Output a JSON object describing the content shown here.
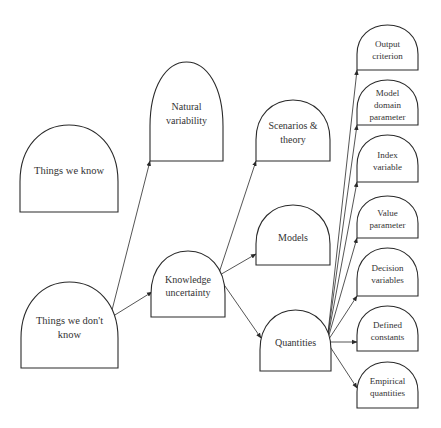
{
  "diagram": {
    "type": "tree",
    "style": {
      "stroke_color": "#2a2a2a",
      "text_color": "#333333",
      "background": "#ffffff"
    },
    "nodes": [
      {
        "id": "known",
        "lines": [
          "Things we know"
        ],
        "box": [
          20,
          125,
          118,
          212
        ],
        "font": 10.5
      },
      {
        "id": "unknown",
        "lines": [
          "Things we don't",
          "know"
        ],
        "box": [
          21,
          282,
          118,
          368
        ],
        "font": 10.5
      },
      {
        "id": "natural",
        "lines": [
          "Natural",
          "variability"
        ],
        "box": [
          150,
          62,
          223,
          161
        ],
        "font": 10
      },
      {
        "id": "knowledge",
        "lines": [
          "Knowledge",
          "uncertainty"
        ],
        "box": [
          151,
          251,
          225,
          317
        ],
        "font": 10
      },
      {
        "id": "scenarios",
        "lines": [
          "Scenarios &",
          "theory"
        ],
        "box": [
          256,
          100,
          330,
          161
        ],
        "font": 10
      },
      {
        "id": "models",
        "lines": [
          "Models"
        ],
        "box": [
          256,
          205,
          330,
          265
        ],
        "font": 10
      },
      {
        "id": "quantities",
        "lines": [
          "Quantities"
        ],
        "box": [
          260,
          310,
          331,
          371
        ],
        "font": 10
      },
      {
        "id": "output",
        "lines": [
          "Output",
          "criterion"
        ],
        "box": [
          357,
          25,
          418,
          70
        ],
        "font": 9
      },
      {
        "id": "model-domain",
        "lines": [
          "Model",
          "domain",
          "parameter"
        ],
        "box": [
          357,
          80,
          418,
          125
        ],
        "font": 9
      },
      {
        "id": "index",
        "lines": [
          "Index",
          "variable"
        ],
        "box": [
          357,
          135,
          418,
          182
        ],
        "font": 9
      },
      {
        "id": "value",
        "lines": [
          "Value",
          "parameter"
        ],
        "box": [
          357,
          196,
          418,
          238
        ],
        "font": 9
      },
      {
        "id": "decision",
        "lines": [
          "Decision",
          "variables"
        ],
        "box": [
          357,
          248,
          418,
          296
        ],
        "font": 9
      },
      {
        "id": "defined",
        "lines": [
          "Defined",
          "constants"
        ],
        "box": [
          357,
          306,
          418,
          351
        ],
        "font": 9
      },
      {
        "id": "empirical",
        "lines": [
          "Empirical",
          "quantities"
        ],
        "box": [
          357,
          362,
          418,
          408
        ],
        "font": 9
      }
    ],
    "edges": [
      {
        "from": "unknown",
        "to": "natural",
        "x1": 110,
        "y1": 318,
        "x2": 150,
        "y2": 161
      },
      {
        "from": "unknown",
        "to": "knowledge",
        "x1": 110,
        "y1": 318,
        "x2": 152,
        "y2": 292
      },
      {
        "from": "knowledge",
        "to": "scenarios",
        "x1": 218,
        "y1": 276,
        "x2": 256,
        "y2": 161
      },
      {
        "from": "knowledge",
        "to": "models",
        "x1": 218,
        "y1": 276,
        "x2": 256,
        "y2": 254
      },
      {
        "from": "knowledge",
        "to": "quantities",
        "x1": 218,
        "y1": 276,
        "x2": 261,
        "y2": 338
      },
      {
        "from": "quantities",
        "to": "output",
        "x1": 327,
        "y1": 342,
        "x2": 357,
        "y2": 70
      },
      {
        "from": "quantities",
        "to": "model-domain",
        "x1": 327,
        "y1": 342,
        "x2": 357,
        "y2": 125
      },
      {
        "from": "quantities",
        "to": "index",
        "x1": 327,
        "y1": 342,
        "x2": 357,
        "y2": 182
      },
      {
        "from": "quantities",
        "to": "value",
        "x1": 327,
        "y1": 342,
        "x2": 357,
        "y2": 238
      },
      {
        "from": "quantities",
        "to": "decision",
        "x1": 327,
        "y1": 342,
        "x2": 357,
        "y2": 296
      },
      {
        "from": "quantities",
        "to": "defined",
        "x1": 327,
        "y1": 342,
        "x2": 357,
        "y2": 342
      },
      {
        "from": "quantities",
        "to": "empirical",
        "x1": 327,
        "y1": 342,
        "x2": 357,
        "y2": 388
      }
    ]
  }
}
